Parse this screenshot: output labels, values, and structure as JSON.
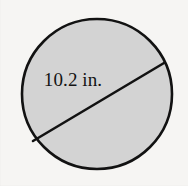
{
  "figure": {
    "type": "geometry-diagram",
    "shape_name": "circle",
    "canvas": {
      "width": 188,
      "height": 186
    },
    "background_color": "#f6f5f3",
    "circle": {
      "center_x": 97,
      "center_y": 94,
      "radius": 75,
      "fill_color": "#d3d3d3",
      "stroke_color": "#121212",
      "stroke_width": 2.6
    },
    "chord": {
      "x1": 33,
      "y1": 141,
      "x2": 164,
      "y2": 63,
      "stroke_color": "#121212",
      "stroke_width": 2.6
    },
    "label": {
      "text": "10.2 in.",
      "value": "10.2",
      "unit": "in.",
      "color": "#141414"
    }
  }
}
